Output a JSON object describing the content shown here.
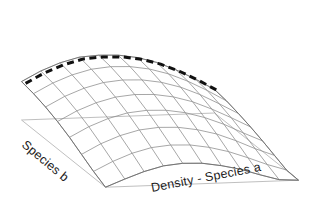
{
  "figure": {
    "type": "surface-plot-3d",
    "background_color": "#ffffff"
  },
  "axes": {
    "x_label": "Density - Species  a",
    "y_label": "Species  b",
    "z_label": ""
  },
  "chart_data": {
    "type": "surface",
    "title": "",
    "xlabel": "Density - Species  a",
    "ylabel": "Species  b",
    "zlabel": "",
    "grid": true,
    "legend": "none",
    "x": [
      0,
      1,
      2,
      3,
      4,
      5,
      6,
      7,
      8,
      9,
      10
    ],
    "y": [
      0,
      1,
      2,
      3,
      4,
      5,
      6,
      7
    ],
    "z_description": "Saddle-shaped response surface: rises to a broad ridge along the far (back) edge and falls steeply toward the near (front-left) corner",
    "z": [
      [
        0.62,
        0.78,
        0.9,
        0.98,
        1.0,
        0.99,
        0.94,
        0.85,
        0.72,
        0.56,
        0.38
      ],
      [
        0.58,
        0.74,
        0.86,
        0.94,
        0.97,
        0.96,
        0.91,
        0.82,
        0.69,
        0.53,
        0.35
      ],
      [
        0.52,
        0.68,
        0.8,
        0.88,
        0.91,
        0.9,
        0.85,
        0.76,
        0.63,
        0.47,
        0.3
      ],
      [
        0.44,
        0.6,
        0.72,
        0.8,
        0.83,
        0.82,
        0.77,
        0.68,
        0.55,
        0.4,
        0.24
      ],
      [
        0.34,
        0.5,
        0.62,
        0.7,
        0.73,
        0.72,
        0.67,
        0.58,
        0.46,
        0.31,
        0.17
      ],
      [
        0.22,
        0.38,
        0.5,
        0.58,
        0.61,
        0.6,
        0.55,
        0.47,
        0.35,
        0.21,
        0.09
      ],
      [
        0.1,
        0.25,
        0.37,
        0.45,
        0.48,
        0.47,
        0.42,
        0.34,
        0.23,
        0.11,
        0.01
      ],
      [
        0.0,
        0.12,
        0.23,
        0.31,
        0.34,
        0.33,
        0.28,
        0.21,
        0.11,
        0.02,
        0.0
      ]
    ],
    "overlay_curve": {
      "name": "ridge-line",
      "style": "dashed",
      "color": "#000000",
      "width": 3,
      "description": "Bold dashed curve tracing the optimum ridge along the back edge of the surface",
      "values": [
        0.62,
        0.78,
        0.9,
        0.98,
        1.0,
        0.99,
        0.94,
        0.85,
        0.72,
        0.56,
        0.38
      ]
    },
    "base_plane": {
      "visible": true,
      "color": "#b4b4b4"
    }
  },
  "colors": {
    "mesh": "#8a8a8a",
    "mesh_back": "#a8a8a8",
    "base_plane": "#b8b8b8",
    "dashed_curve": "#111111",
    "text": "#1c1c1c",
    "background": "#ffffff"
  }
}
